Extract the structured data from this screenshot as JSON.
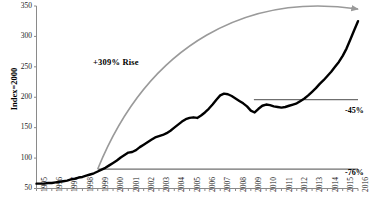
{
  "chart_data": {
    "type": "line",
    "title": "",
    "subtitle": "",
    "xlabel": "",
    "ylabel": "Index=2000",
    "xlim": [
      1995,
      2016
    ],
    "ylim": [
      50,
      350
    ],
    "grid": false,
    "legend": "none",
    "yticks": [
      50,
      100,
      150,
      200,
      250,
      300,
      350
    ],
    "ytick_labels": [
      "50",
      "100",
      "150",
      "200",
      "250",
      "300",
      "350"
    ],
    "xticks": [
      1995,
      1996,
      1997,
      1998,
      1999,
      2000,
      2001,
      2002,
      2003,
      2004,
      2005,
      2006,
      2007,
      2008,
      2009,
      2010,
      2011,
      2012,
      2013,
      2014,
      2015,
      2016
    ],
    "xtick_labels": [
      "1995",
      "1996",
      "1997",
      "1998",
      "1999",
      "2000",
      "2001",
      "2002",
      "2003",
      "2004",
      "2005",
      "2006",
      "2007",
      "2008",
      "2009",
      "2010",
      "2011",
      "2012",
      "2013",
      "2014",
      "2015",
      "2016"
    ],
    "series": [
      {
        "name": "Index",
        "color": "#000000",
        "x": [
          1995.0,
          1995.25,
          1995.5,
          1995.75,
          1996.0,
          1996.25,
          1996.5,
          1996.75,
          1997.0,
          1997.25,
          1997.5,
          1997.75,
          1998.0,
          1998.25,
          1998.5,
          1998.75,
          1999.0,
          1999.25,
          1999.5,
          1999.75,
          2000.0,
          2000.25,
          2000.5,
          2000.75,
          2001.0,
          2001.25,
          2001.5,
          2001.75,
          2002.0,
          2002.25,
          2002.5,
          2002.75,
          2003.0,
          2003.25,
          2003.5,
          2003.75,
          2004.0,
          2004.25,
          2004.5,
          2004.75,
          2005.0,
          2005.25,
          2005.5,
          2005.75,
          2006.0,
          2006.25,
          2006.5,
          2006.75,
          2007.0,
          2007.25,
          2007.5,
          2007.75,
          2008.0,
          2008.25,
          2008.5,
          2008.75,
          2009.0,
          2009.25,
          2009.5,
          2009.75,
          2010.0,
          2010.25,
          2010.5,
          2010.75,
          2011.0,
          2011.25,
          2011.5,
          2011.75,
          2012.0,
          2012.25,
          2012.5,
          2012.75,
          2013.0,
          2013.25,
          2013.5,
          2013.75,
          2014.0,
          2014.25,
          2014.5,
          2014.75,
          2015.0,
          2015.25,
          2015.5,
          2015.75,
          2016.0
        ],
        "y": [
          58,
          58,
          58,
          59,
          59,
          60,
          61,
          62,
          63,
          65,
          66,
          68,
          69,
          71,
          73,
          75,
          78,
          81,
          84,
          88,
          92,
          96,
          101,
          105,
          109,
          110,
          113,
          118,
          122,
          126,
          130,
          134,
          136,
          138,
          141,
          145,
          150,
          155,
          160,
          164,
          166,
          167,
          166,
          170,
          175,
          181,
          188,
          196,
          203,
          206,
          205,
          202,
          198,
          194,
          190,
          185,
          178,
          175,
          181,
          186,
          188,
          187,
          185,
          184,
          183,
          184,
          186,
          188,
          190,
          194,
          198,
          203,
          209,
          215,
          222,
          228,
          235,
          242,
          250,
          258,
          268,
          280,
          295,
          310,
          325
        ]
      }
    ],
    "annotations": [
      {
        "id": "rise-label",
        "text": "+309% Rise",
        "x": 1999.6,
        "y": 268
      },
      {
        "id": "drop-45-label",
        "text": "-45%",
        "x": 2016.3,
        "y": 196
      },
      {
        "id": "drop-76-label",
        "text": "-76%",
        "x": 2016.3,
        "y": 82
      }
    ],
    "reference_lines": [
      {
        "id": "line-45",
        "label": "-45%",
        "value": 196,
        "x_start": 2009.2,
        "x_end": 2016.0,
        "color": "#6f6f6f"
      },
      {
        "id": "line-76",
        "label": "-76%",
        "value": 82,
        "x_start": 1999.0,
        "x_end": 2016.0,
        "color": "#6f6f6f"
      }
    ],
    "arrow": {
      "id": "rise-arrow",
      "color": "#9a9a9a",
      "start": {
        "x": 1999.0,
        "y": 82
      },
      "end": {
        "x": 2016.0,
        "y": 345
      },
      "style": "curved-arc-with-arrowhead"
    },
    "colors": {
      "line": "#000000",
      "reference": "#6f6f6f",
      "arrow": "#9a9a9a",
      "axis": "#8a8a8a",
      "text": "#222222",
      "background": "#ffffff"
    }
  }
}
